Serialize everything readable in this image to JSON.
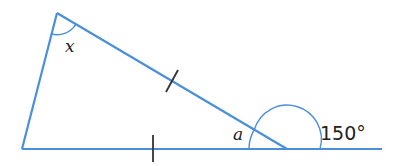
{
  "diagram": {
    "type": "geometry-triangle",
    "colors": {
      "line": "#4a8fdb",
      "tick": "#333333",
      "text": "#222222"
    },
    "vertices": {
      "top": [
        57,
        13
      ],
      "bottom_left": [
        22,
        149
      ],
      "right": [
        287,
        149
      ]
    },
    "baseline_end": [
      382,
      149
    ],
    "labels": {
      "angle_top": "x",
      "angle_right_interior": "a",
      "exterior_angle": "150°"
    },
    "equal_sides": [
      "bottom_left-right",
      "top-right"
    ]
  }
}
